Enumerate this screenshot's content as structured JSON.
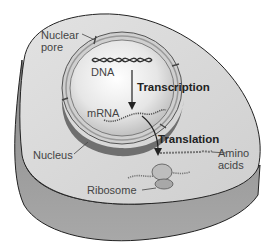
{
  "diagram": {
    "labels": {
      "nuclear_pore_line1": "Nuclear",
      "nuclear_pore_line2": "pore",
      "dna": "DNA",
      "transcription": "Transcription",
      "mrna": "mRNA",
      "translation": "Translation",
      "nucleus": "Nucleus",
      "amino_line1": "Amino",
      "amino_line2": "acids",
      "ribosome": "Ribosome"
    },
    "colors": {
      "cytoplasm_top": "#d8d8d8",
      "cell_side": "#9a9a9a",
      "nucleus_interior": "#ececec",
      "nucleus_side": "#7e7e7e",
      "outline": "#222222",
      "text": "#444444",
      "bold_text": "#222222"
    }
  }
}
